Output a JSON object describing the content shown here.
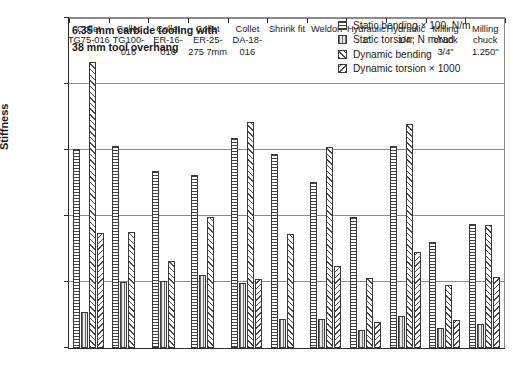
{
  "chart_data": {
    "type": "bar",
    "title": "",
    "annotation": "6.35 mm carbide tooling with\n38 mm tool overhang",
    "xlabel": "",
    "ylabel": "Stiffness",
    "ylim": [
      0,
      25000
    ],
    "ytick_values": [
      0,
      5000,
      10000,
      15000,
      20000,
      25000
    ],
    "ytick_labels": [
      "0",
      "5,000",
      "10,000",
      "15,000",
      "20,000",
      "25,000"
    ],
    "grid": true,
    "legend_position": "top-right",
    "categories": [
      "Collet TG75-016",
      "Collet TG100-016",
      "Collet ER-16-016",
      "Collet ER-25-275 7mm",
      "Collet DA-18-016",
      "Shrink fit",
      "Weldon",
      "Hydraulic 1\"",
      "Hydraulic 1/4\"",
      "Milling chuck 3/4\"",
      "Milling chuck 1.250\""
    ],
    "category_lines": [
      [
        "Collet",
        "TG75-016"
      ],
      [
        "Collet",
        "TG100-",
        "016"
      ],
      [
        "Collet",
        "ER-16-",
        "016"
      ],
      [
        "Collet",
        "ER-25-",
        "275  7mm"
      ],
      [
        "Collet",
        "DA-18-",
        "016"
      ],
      [
        "Shrink fit"
      ],
      [
        "Weldon"
      ],
      [
        "Hydraulic",
        "1\""
      ],
      [
        "Hydraulic",
        "1/4\""
      ],
      [
        "Milling",
        "chuck",
        "3/4\""
      ],
      [
        "Milling",
        "chuck",
        "1.250\""
      ]
    ],
    "series": [
      {
        "name": "Static bending × 100, N/m",
        "pattern": "horizontal-lines",
        "values": [
          15100,
          15300,
          13400,
          13100,
          15900,
          14700,
          12600,
          9900,
          15300,
          8000,
          9400
        ]
      },
      {
        "name": "Static torsion, N m/rad",
        "pattern": "vertical-lines",
        "values": [
          2700,
          5000,
          5100,
          5500,
          4900,
          2200,
          2200,
          1400,
          2400,
          1500,
          1800
        ]
      },
      {
        "name": "Dynamic bending",
        "pattern": "diagonal-hatch-up",
        "values": [
          21700,
          8800,
          6600,
          9900,
          17100,
          8600,
          15200,
          5300,
          17000,
          4800,
          9300
        ]
      },
      {
        "name": "Dynamic torsion × 1000",
        "pattern": "diagonal-hatch-down",
        "values": [
          8700,
          0,
          0,
          0,
          5200,
          0,
          6200,
          2000,
          7300,
          2100,
          5400
        ]
      }
    ]
  },
  "legend": {
    "items": [
      "Static bending × 100, N/m",
      "Static torsion, N m/rad",
      "Dynamic bending",
      "Dynamic torsion × 1000"
    ]
  }
}
